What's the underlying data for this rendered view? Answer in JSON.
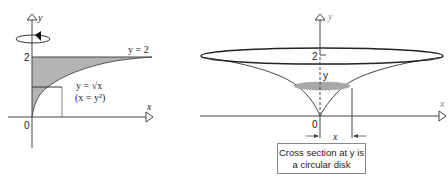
{
  "left_figure": {
    "axis_x_label": "x",
    "axis_y_label": "y",
    "origin_label": "0",
    "tick_y_label": "2",
    "top_line_label": "y = 2",
    "curve_label_line1": "y = √x",
    "curve_label_line2": "(x = y²)",
    "rotation_icon": "rotation-arrow-icon",
    "region_fill": "#b4b4b4"
  },
  "right_figure": {
    "axis_x_label": "x",
    "axis_y_label": "y",
    "origin_label": "0",
    "tick_y_label": "2",
    "cross_section_y_label": "y",
    "radius_label": "x",
    "disk_fill": "#a8a8a8",
    "caption_line1": "Cross section at y is",
    "caption_line2": "a circular disk"
  }
}
